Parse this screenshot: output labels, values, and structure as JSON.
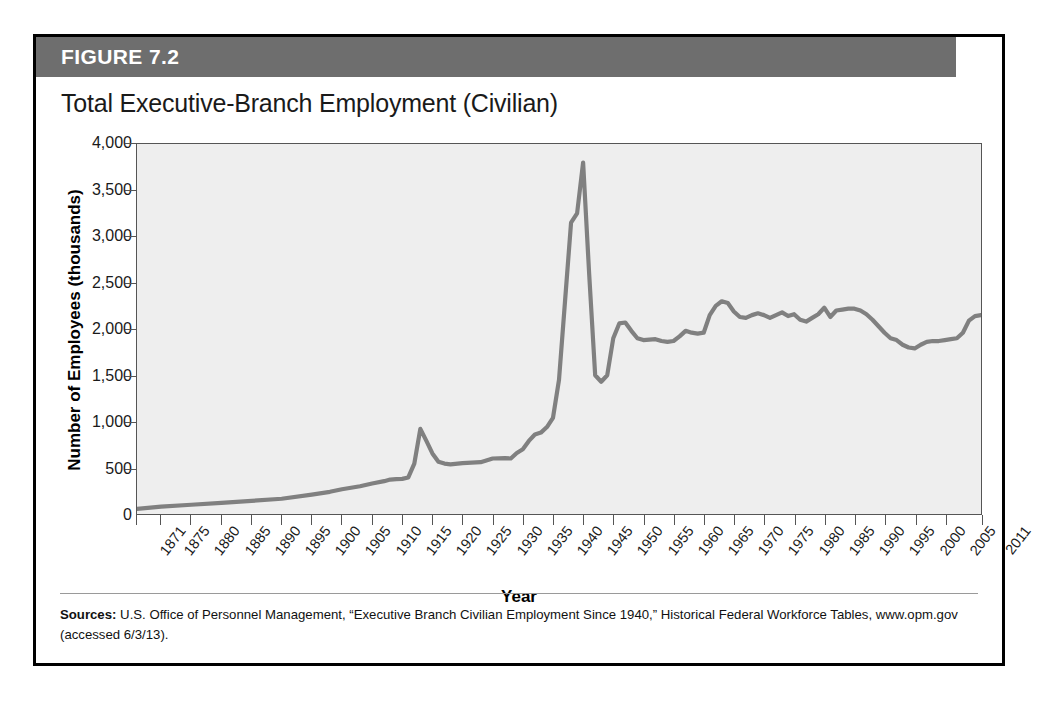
{
  "figure": {
    "header_label": "FIGURE 7.2",
    "title": "Total Executive-Branch Employment (Civilian)",
    "source_label": "Sources:",
    "source_text": " U.S. Office of Personnel Management, “Executive Branch Civilian Employment Since 1940,” Historical Federal Workforce Tables, www.opm.gov (accessed 6/3/13)."
  },
  "colors": {
    "header_bar": "#6e6e6e",
    "frame_border": "#000000",
    "plot_background": "#eeeeee",
    "plot_border": "#555555",
    "line": "#808080"
  },
  "chart_data": {
    "type": "line",
    "title": "Total Executive-Branch Employment (Civilian)",
    "xlabel": "Year",
    "ylabel": "Number of Employees (thousands)",
    "xlim": [
      1871,
      2011
    ],
    "ylim": [
      0,
      4000
    ],
    "grid": false,
    "legend": "none",
    "y_ticks": [
      0,
      500,
      1000,
      1500,
      2000,
      2500,
      3000,
      3500,
      4000
    ],
    "y_tick_labels": [
      "0",
      "500",
      "1,000",
      "1,500",
      "2,000",
      "2,500",
      "3,000",
      "3,500",
      "4,000"
    ],
    "x_ticks": [
      1871,
      1875,
      1880,
      1885,
      1890,
      1895,
      1900,
      1905,
      1910,
      1915,
      1920,
      1925,
      1930,
      1935,
      1940,
      1945,
      1950,
      1955,
      1960,
      1965,
      1970,
      1975,
      1980,
      1985,
      1990,
      1995,
      2000,
      2005,
      2011
    ],
    "x_tick_labels": [
      "1871",
      "1875",
      "1880",
      "1885",
      "1890",
      "1895",
      "1900",
      "1905",
      "1910",
      "1915",
      "1920",
      "1925",
      "1930",
      "1935",
      "1940",
      "1945",
      "1950",
      "1955",
      "1960",
      "1965",
      "1970",
      "1975",
      "1980",
      "1985",
      "1990",
      "1995",
      "2000",
      "2005",
      "2011"
    ],
    "series": [
      {
        "name": "Total Executive-Branch Employment (Civilian)",
        "x": [
          1871,
          1875,
          1880,
          1885,
          1890,
          1895,
          1900,
          1903,
          1905,
          1908,
          1910,
          1912,
          1914,
          1916,
          1917,
          1918,
          1919,
          1920,
          1921,
          1922,
          1923,
          1925,
          1928,
          1930,
          1932,
          1933,
          1934,
          1935,
          1936,
          1937,
          1938,
          1939,
          1940,
          1941,
          1942,
          1943,
          1944,
          1945,
          1946,
          1947,
          1948,
          1949,
          1950,
          1951,
          1952,
          1953,
          1954,
          1955,
          1956,
          1957,
          1958,
          1959,
          1960,
          1961,
          1962,
          1963,
          1964,
          1965,
          1966,
          1967,
          1968,
          1969,
          1970,
          1971,
          1972,
          1973,
          1974,
          1975,
          1976,
          1977,
          1978,
          1979,
          1980,
          1981,
          1982,
          1983,
          1984,
          1985,
          1986,
          1987,
          1988,
          1989,
          1990,
          1991,
          1992,
          1993,
          1994,
          1995,
          1996,
          1997,
          1998,
          1999,
          2000,
          2001,
          2002,
          2003,
          2004,
          2005,
          2006,
          2007,
          2008,
          2009,
          2010,
          2011
        ],
        "y": [
          51,
          80,
          100,
          120,
          140,
          160,
          208,
          240,
          270,
          300,
          330,
          360,
          396,
          438,
          560,
          917,
          794,
          655,
          561,
          543,
          536,
          553,
          560,
          601,
          605,
          604,
          699,
          780,
          867,
          895,
          882,
          954,
          1042,
          1438,
          2296,
          3270,
          3304,
          3816,
          2696,
          2111,
          1873,
          1909,
          1934,
          2456,
          2574,
          2532,
          2382,
          2371,
          2372,
          2391,
          2355,
          2355,
          2371,
          2407,
          2485,
          2489,
          2470,
          2496,
          2726,
          2877,
          2951,
          2969,
          2944,
          2860,
          2795,
          2781,
          2847,
          2848,
          2833,
          2840,
          2875,
          2823,
          2821,
          2806,
          2770,
          2820,
          2854,
          3008,
          3019,
          3091,
          3113,
          3064,
          3067,
          3048,
          3017,
          2950,
          2908,
          2858,
          2786,
          2806,
          2772,
          2769,
          2639,
          2640,
          2630,
          2666,
          2650,
          2654,
          2637,
          2636,
          2692,
          2774,
          2776,
          2756
        ]
      }
    ],
    "line_y_rendered": [
      [
        1871,
        55
      ],
      [
        1875,
        80
      ],
      [
        1880,
        100
      ],
      [
        1885,
        120
      ],
      [
        1890,
        142
      ],
      [
        1895,
        165
      ],
      [
        1900,
        210
      ],
      [
        1903,
        240
      ],
      [
        1905,
        268
      ],
      [
        1908,
        300
      ],
      [
        1910,
        330
      ],
      [
        1912,
        355
      ],
      [
        1913,
        372
      ],
      [
        1914,
        378
      ],
      [
        1915,
        380
      ],
      [
        1916,
        395
      ],
      [
        1917,
        545
      ],
      [
        1918,
        920
      ],
      [
        1919,
        790
      ],
      [
        1920,
        655
      ],
      [
        1921,
        565
      ],
      [
        1922,
        545
      ],
      [
        1923,
        537
      ],
      [
        1925,
        550
      ],
      [
        1928,
        560
      ],
      [
        1930,
        600
      ],
      [
        1932,
        605
      ],
      [
        1933,
        600
      ],
      [
        1934,
        660
      ],
      [
        1935,
        700
      ],
      [
        1936,
        790
      ],
      [
        1937,
        860
      ],
      [
        1938,
        880
      ],
      [
        1939,
        940
      ],
      [
        1940,
        1040
      ],
      [
        1941,
        1450
      ],
      [
        1942,
        2300
      ],
      [
        1943,
        3150
      ],
      [
        1944,
        3250
      ],
      [
        1945,
        3800
      ],
      [
        1946,
        2600
      ],
      [
        1947,
        1500
      ],
      [
        1948,
        1430
      ],
      [
        1949,
        1500
      ],
      [
        1950,
        1900
      ],
      [
        1951,
        2060
      ],
      [
        1952,
        2070
      ],
      [
        1953,
        1980
      ],
      [
        1954,
        1900
      ],
      [
        1955,
        1880
      ],
      [
        1957,
        1890
      ],
      [
        1958,
        1870
      ],
      [
        1959,
        1860
      ],
      [
        1960,
        1870
      ],
      [
        1961,
        1920
      ],
      [
        1962,
        1980
      ],
      [
        1963,
        1960
      ],
      [
        1964,
        1950
      ],
      [
        1965,
        1960
      ],
      [
        1966,
        2150
      ],
      [
        1967,
        2250
      ],
      [
        1968,
        2300
      ],
      [
        1969,
        2280
      ],
      [
        1970,
        2190
      ],
      [
        1971,
        2130
      ],
      [
        1972,
        2120
      ],
      [
        1973,
        2150
      ],
      [
        1974,
        2170
      ],
      [
        1975,
        2150
      ],
      [
        1976,
        2120
      ],
      [
        1977,
        2150
      ],
      [
        1978,
        2180
      ],
      [
        1979,
        2140
      ],
      [
        1980,
        2160
      ],
      [
        1981,
        2100
      ],
      [
        1982,
        2080
      ],
      [
        1983,
        2120
      ],
      [
        1984,
        2160
      ],
      [
        1985,
        2230
      ],
      [
        1986,
        2130
      ],
      [
        1987,
        2200
      ],
      [
        1988,
        2210
      ],
      [
        1989,
        2220
      ],
      [
        1990,
        2220
      ],
      [
        1991,
        2200
      ],
      [
        1992,
        2160
      ],
      [
        1993,
        2100
      ],
      [
        1994,
        2030
      ],
      [
        1995,
        1960
      ],
      [
        1996,
        1900
      ],
      [
        1997,
        1880
      ],
      [
        1998,
        1830
      ],
      [
        1999,
        1800
      ],
      [
        2000,
        1790
      ],
      [
        2001,
        1830
      ],
      [
        2002,
        1860
      ],
      [
        2003,
        1870
      ],
      [
        2004,
        1870
      ],
      [
        2005,
        1880
      ],
      [
        2006,
        1890
      ],
      [
        2007,
        1900
      ],
      [
        2008,
        1960
      ],
      [
        2009,
        2090
      ],
      [
        2010,
        2140
      ],
      [
        2011,
        2150
      ]
    ],
    "annotations": [
      {
        "label": "World War I peak",
        "year": 1918,
        "value": 920
      },
      {
        "label": "World War II peak",
        "year": 1945,
        "value": 3800
      },
      {
        "label": "Post-war low",
        "year": 1948,
        "value": 1430
      },
      {
        "label": "Recent low",
        "year": 2000,
        "value": 1790
      },
      {
        "label": "Series end",
        "year": 2011,
        "value": 2150
      }
    ]
  }
}
